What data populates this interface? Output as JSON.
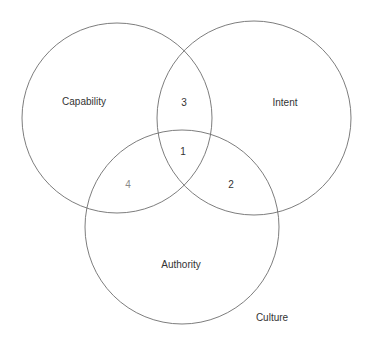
{
  "diagram": {
    "type": "venn",
    "stroke_color": "#6e6e6e",
    "circles": [
      {
        "name": "Capability",
        "cx": 117,
        "cy": 118,
        "r": 95
      },
      {
        "name": "Intent",
        "cx": 254,
        "cy": 118,
        "r": 97
      },
      {
        "name": "Authority",
        "cx": 182,
        "cy": 227,
        "r": 97
      }
    ],
    "labels": {
      "capability": "Capability",
      "intent": "Intent",
      "authority": "Authority",
      "culture": "Culture",
      "region_1": "1",
      "region_2": "2",
      "region_3": "3",
      "region_4": "4"
    },
    "regions": [
      {
        "id": "1",
        "sets": [
          "Capability",
          "Intent",
          "Authority"
        ]
      },
      {
        "id": "2",
        "sets": [
          "Intent",
          "Authority"
        ]
      },
      {
        "id": "3",
        "sets": [
          "Capability",
          "Intent"
        ]
      },
      {
        "id": "4",
        "sets": [
          "Capability",
          "Authority"
        ]
      }
    ],
    "context_label": "Culture"
  }
}
